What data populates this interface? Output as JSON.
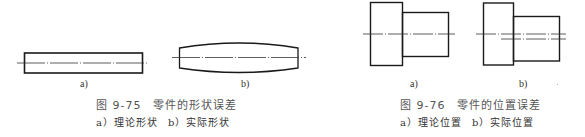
{
  "figures": [
    {
      "id": "9-75",
      "title": "图 9-75　零件的形状误差",
      "subcaption": {
        "a": "a）理论形状",
        "b": "b）实际形状"
      },
      "panels": [
        {
          "label": "a)",
          "description": "theoretical shape: rectangle with center line"
        },
        {
          "label": "b)",
          "description": "actual shape: barrel-shaped outline with center line"
        }
      ]
    },
    {
      "id": "9-76",
      "title": "图 9-76　零件的位置误差",
      "subcaption": {
        "a": "a）理论位置",
        "b": "b）实际位置"
      },
      "panels": [
        {
          "label": "a)",
          "description": "theoretical position: stepped shaft with coaxial center line"
        },
        {
          "label": "b)",
          "description": "actual position: stepped shaft with offset second center line"
        }
      ]
    }
  ],
  "colors": {
    "line": "#1a1a1a",
    "centerline": "#333333",
    "caption": "#555555"
  }
}
